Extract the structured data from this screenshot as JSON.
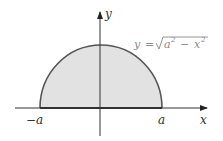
{
  "diagram": {
    "type": "semicircle-region",
    "equation": {
      "lhs": "y",
      "eq": "=",
      "radicand_a": "a",
      "a_exp": "2",
      "minus": "−",
      "radicand_x": "x",
      "x_exp": "2",
      "full": "y = √(a² − x²)"
    },
    "axes": {
      "x_label": "x",
      "y_label": "y"
    },
    "ticks": {
      "left": "−a",
      "right": "a"
    },
    "colors": {
      "fill": "#e2e2e2",
      "curve": "#555555",
      "axis": "#333333",
      "equation": "#8a8a8a"
    }
  }
}
